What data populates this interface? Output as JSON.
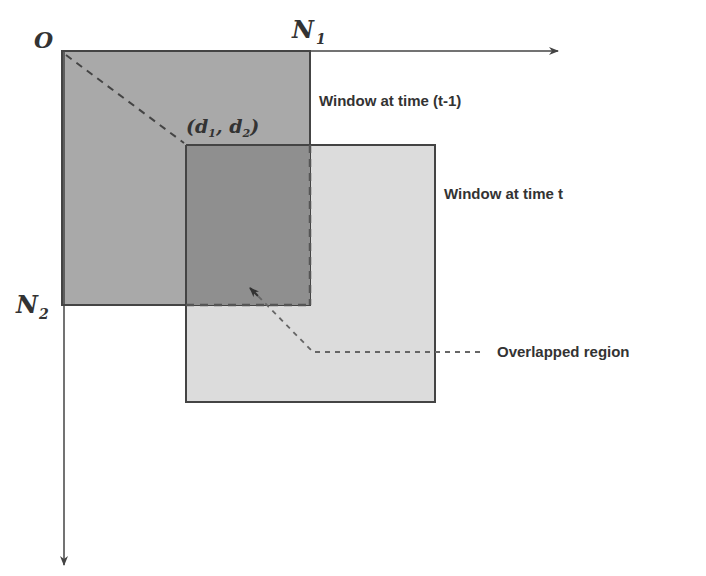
{
  "diagram": {
    "type": "overlapping-windows",
    "axes": {
      "origin_label": "O",
      "x_axis_label": "N",
      "x_axis_subscript": "1",
      "y_axis_label": "N",
      "y_axis_subscript": "2"
    },
    "offset_point": {
      "open": "(",
      "d1": "d",
      "d1_sub": "1",
      "sep": ", ",
      "d2": "d",
      "d2_sub": "2",
      "close": ")"
    },
    "windows": [
      {
        "id": "prev",
        "label": "Window at time (t-1)",
        "fill": "#a9a9a9"
      },
      {
        "id": "curr",
        "label": "Window at time t",
        "fill": "#dcdcdc"
      }
    ],
    "overlap": {
      "label": "Overlapped region",
      "fill": "#8f8f8f"
    },
    "colors": {
      "stroke": "#444444",
      "dashed": "#555555",
      "text": "#333333"
    }
  }
}
